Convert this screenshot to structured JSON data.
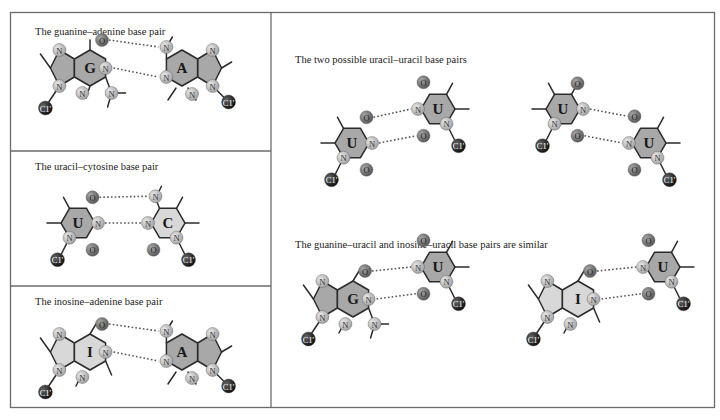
{
  "colors": {
    "frame": "#6b6b6b",
    "ring_dark": "#a8a8a8",
    "ring_light": "#d8d8d8",
    "atom_N": "#b9b9b9",
    "atom_O": "#7a7a7a",
    "atom_C1": "#1a1a1a",
    "bond": "#2b2b2b"
  },
  "panels": [
    {
      "id": "ga",
      "title": "The guanine–adenine base pair"
    },
    {
      "id": "uc",
      "title": "The uracil–cytosine base pair"
    },
    {
      "id": "ia",
      "title": "The inosine–adenine base pair"
    },
    {
      "id": "uu",
      "title": "The two possible uracil–uracil base pairs"
    },
    {
      "id": "gu_iu",
      "title": "The guanine–uracil and inosine–uracil base pairs are similar"
    }
  ],
  "atom_labels": {
    "N": "N",
    "O": "O",
    "C1": "C1'"
  },
  "molecules": [
    {
      "panel": "ga",
      "base": "G",
      "letter": "G",
      "shade": "dark",
      "rings": [
        {
          "shade": "dark",
          "pts": [
            [
              84,
              47
            ],
            [
              102,
              57
            ],
            [
              102,
              77
            ],
            [
              84,
              87
            ],
            [
              66,
              77
            ],
            [
              66,
              57
            ]
          ]
        },
        {
          "shade": "dark",
          "pts": [
            [
              66,
              57
            ],
            [
              66,
              77
            ],
            [
              50,
              82
            ],
            [
              40,
              67
            ],
            [
              50,
              52
            ]
          ]
        }
      ],
      "atoms": [
        [
          "N",
          70,
          46
        ],
        [
          "O",
          102,
          46
        ],
        [
          "N",
          116,
          78
        ],
        [
          "N",
          54,
          82
        ],
        [
          "N",
          84,
          99
        ],
        [
          "N",
          120,
          106
        ],
        [
          "C1",
          38,
          108
        ]
      ],
      "bonds": [
        [
          50,
          52,
          42,
          46
        ],
        [
          84,
          87,
          80,
          100
        ],
        [
          102,
          77,
          118,
          104
        ],
        [
          118,
          106,
          134,
          106
        ],
        [
          118,
          106,
          110,
          118
        ],
        [
          102,
          57,
          102,
          46
        ]
      ]
    },
    {
      "panel": "ga",
      "base": "A",
      "letter": "A",
      "shade": "dark",
      "rings": [
        {
          "shade": "dark",
          "pts": [
            [
              180,
              57
            ],
            [
              198,
              47
            ],
            [
              216,
              57
            ],
            [
              216,
              77
            ],
            [
              198,
              87
            ],
            [
              180,
              77
            ]
          ]
        },
        {
          "shade": "dark",
          "pts": [
            [
              198,
              47
            ],
            [
              216,
              57
            ],
            [
              232,
              52
            ],
            [
              240,
              67
            ],
            [
              228,
              82
            ],
            [
              216,
              77
            ]
          ]
        }
      ],
      "atoms": [
        [
          "N",
          163,
          59
        ],
        [
          "N",
          163,
          89
        ],
        [
          "N",
          210,
          47
        ],
        [
          "N",
          226,
          84
        ],
        [
          "N",
          194,
          105
        ],
        [
          "C1",
          242,
          108
        ]
      ],
      "bonds": [
        [
          163,
          59,
          170,
          45
        ],
        [
          180,
          77,
          170,
          100
        ],
        [
          198,
          87,
          206,
          100
        ],
        [
          232,
          52,
          242,
          46
        ]
      ]
    },
    {
      "panel": "uc",
      "base": "U",
      "letter": "U",
      "shade": "dark",
      "rings": [
        {
          "shade": "dark",
          "pts": [
            [
              70,
              201
            ],
            [
              90,
              201
            ],
            [
              100,
              218
            ],
            [
              90,
              235
            ],
            [
              70,
              235
            ],
            [
              60,
              218
            ]
          ]
        }
      ],
      "atoms": [
        [
          "O",
          98,
          188
        ],
        [
          "N",
          100,
          222
        ],
        [
          "N",
          70,
          246
        ],
        [
          "O",
          98,
          254
        ],
        [
          "C1",
          56,
          268
        ]
      ],
      "bonds": [
        [
          70,
          201,
          64,
          190
        ],
        [
          60,
          218,
          46,
          218
        ]
      ]
    },
    {
      "panel": "uc",
      "base": "C",
      "letter": "C",
      "shade": "light",
      "rings": [
        {
          "shade": "light",
          "pts": [
            [
              162,
              201
            ],
            [
              182,
              201
            ],
            [
              192,
              218
            ],
            [
              182,
              235
            ],
            [
              162,
              235
            ],
            [
              152,
              218
            ]
          ]
        }
      ],
      "atoms": [
        [
          "N",
          148,
          188
        ],
        [
          "N",
          143,
          222
        ],
        [
          "O",
          144,
          255
        ],
        [
          "N",
          176,
          247
        ],
        [
          "C1",
          184,
          268
        ]
      ],
      "bonds": [
        [
          148,
          188,
          154,
          176
        ],
        [
          182,
          201,
          188,
          190
        ],
        [
          192,
          218,
          206,
          218
        ]
      ]
    },
    {
      "panel": "ia",
      "base": "I",
      "letter": "I",
      "shade": "light",
      "rings": [
        {
          "shade": "light",
          "pts": [
            [
              84,
              332
            ],
            [
              102,
              342
            ],
            [
              102,
              362
            ],
            [
              84,
              372
            ],
            [
              66,
              362
            ],
            [
              66,
              342
            ]
          ]
        },
        {
          "shade": "light",
          "pts": [
            [
              66,
              342
            ],
            [
              66,
              362
            ],
            [
              50,
              367
            ],
            [
              40,
              352
            ],
            [
              50,
              337
            ]
          ]
        }
      ],
      "atoms": [
        [
          "N",
          70,
          330
        ],
        [
          "O",
          102,
          329
        ],
        [
          "N",
          116,
          364
        ],
        [
          "N",
          54,
          356
        ],
        [
          "N",
          84,
          383
        ]
      ],
      "bonds": [
        [
          50,
          337,
          42,
          330
        ],
        [
          84,
          372,
          80,
          388
        ],
        [
          102,
          362,
          114,
          390
        ],
        [
          84,
          372,
          84,
          372
        ]
      ]
    },
    {
      "panel": "ia",
      "base": "A",
      "letter": "A",
      "shade": "dark",
      "rings": [
        {
          "shade": "dark",
          "pts": [
            [
              180,
              342
            ],
            [
              198,
              332
            ],
            [
              216,
              342
            ],
            [
              216,
              362
            ],
            [
              198,
              372
            ],
            [
              180,
              362
            ]
          ]
        },
        {
          "shade": "dark",
          "pts": [
            [
              198,
              332
            ],
            [
              216,
              342
            ],
            [
              232,
              337
            ],
            [
              240,
              352
            ],
            [
              228,
              367
            ],
            [
              216,
              362
            ]
          ]
        }
      ],
      "atoms": [
        [
          "N",
          163,
          344
        ],
        [
          "N",
          163,
          364
        ],
        [
          "N",
          210,
          330
        ],
        [
          "N",
          226,
          360
        ],
        [
          "N",
          194,
          383
        ],
        [
          "C1",
          242,
          383
        ]
      ],
      "bonds": [
        [
          163,
          344,
          170,
          328
        ],
        [
          180,
          362,
          170,
          388
        ],
        [
          198,
          372,
          206,
          388
        ],
        [
          232,
          337,
          242,
          330
        ]
      ]
    }
  ],
  "glycosidic_C1": [
    {
      "panel": "ia",
      "x": 38,
      "y": 383
    }
  ]
}
